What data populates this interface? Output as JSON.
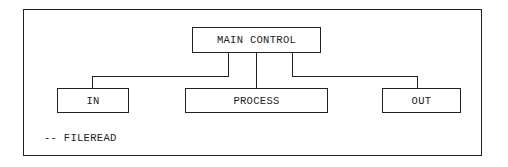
{
  "diagram": {
    "type": "hierarchy-chart",
    "root": {
      "label": "MAIN CONTROL"
    },
    "children": [
      {
        "label": "IN"
      },
      {
        "label": "PROCESS"
      },
      {
        "label": "OUT"
      }
    ],
    "note": "-- FILEREAD"
  }
}
